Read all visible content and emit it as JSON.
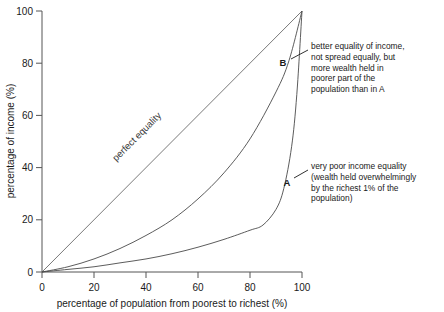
{
  "chart_data": {
    "type": "line",
    "title": "",
    "xlabel": "percentage of population from poorest to richest (%)",
    "ylabel": "percentage of income (%)",
    "xlim": [
      0,
      100
    ],
    "ylim": [
      0,
      100
    ],
    "xticks": [
      "0",
      "20",
      "40",
      "60",
      "80",
      "100"
    ],
    "yticks": [
      "0",
      "20",
      "40",
      "60",
      "80",
      "100"
    ],
    "grid": false,
    "legend_position": "none",
    "series": [
      {
        "name": "perfect equality",
        "label": "perfect equality",
        "x": [
          0,
          10,
          20,
          30,
          40,
          50,
          60,
          70,
          80,
          90,
          100
        ],
        "values": [
          0,
          10,
          20,
          30,
          40,
          50,
          60,
          70,
          80,
          90,
          100
        ]
      },
      {
        "name": "B",
        "label": "B",
        "x": [
          0,
          10,
          20,
          30,
          40,
          50,
          60,
          70,
          80,
          90,
          95,
          100
        ],
        "values": [
          0,
          2,
          5,
          9,
          14,
          20,
          28,
          38,
          51,
          69,
          81,
          100
        ]
      },
      {
        "name": "A",
        "label": "A",
        "x": [
          0,
          10,
          20,
          30,
          40,
          50,
          60,
          70,
          80,
          85,
          90,
          93,
          96,
          98,
          100
        ],
        "values": [
          0,
          1,
          2,
          3.5,
          5,
          7,
          9.5,
          12.5,
          16,
          18,
          24,
          32,
          48,
          68,
          100
        ]
      }
    ],
    "annotations": [
      {
        "tag": "B",
        "tag_x": 95,
        "tag_y": 81,
        "text": "better equality of income,\nnot spread equally, but\nmore wealth held in\npoorer part of the\npopulation than in A"
      },
      {
        "tag": "A",
        "tag_x": 94,
        "tag_y": 35,
        "text": "very poor income equality\n(wealth held overwhelmingly\nby the richest 1% of the\npopulation)"
      }
    ],
    "colors": {
      "axis": "#555555",
      "curve": "#4a4a4a",
      "text": "#1a1a1a",
      "background": "#ffffff"
    }
  }
}
